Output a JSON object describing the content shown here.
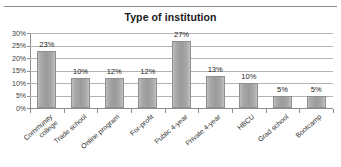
{
  "chart_data": {
    "type": "bar",
    "title": "Type of institution",
    "xlabel": "",
    "ylabel": "",
    "categories": [
      "Community college",
      "Trade school",
      "Online program",
      "For-profit",
      "Public 4-year",
      "Private 4-year",
      "HBCU",
      "Grad school",
      "Bootcamp"
    ],
    "values": [
      23,
      12,
      12,
      12,
      27,
      13,
      10,
      5,
      5
    ],
    "value_labels": [
      "23%",
      "10%",
      "12%",
      "12%",
      "27%",
      "13%",
      "10%",
      "5%",
      "5%"
    ],
    "ylim": [
      0,
      30
    ],
    "ytick_labels": [
      "30%",
      "25%",
      "20%",
      "15%",
      "10%",
      "5%",
      "0%"
    ],
    "ytick_values": [
      30,
      25,
      20,
      15,
      10,
      5,
      0
    ],
    "grid": true,
    "legend": false,
    "bar_color": "#a0a0a0",
    "gridline_color": "#b4b4b4",
    "axis_color": "#8c8c8c",
    "title_color": "#1a1a1a"
  }
}
